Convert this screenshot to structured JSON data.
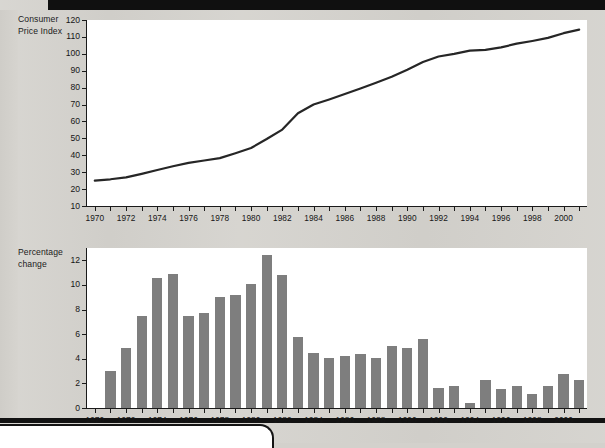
{
  "page": {
    "background_color": "#d4d2cd",
    "bar_color": "#7e7e7e",
    "line_color": "#262626",
    "axis_color": "#1a1a1a",
    "plot_background": "#ffffff"
  },
  "charts": {
    "cpi": {
      "axis_title_line1": "Consumer",
      "axis_title_line2": "Price Index",
      "y_ticks": [
        "120",
        "110",
        "100",
        "90",
        "80",
        "70",
        "60",
        "50",
        "40",
        "30",
        "20",
        "10"
      ],
      "x_ticks": [
        "1970",
        "1972",
        "1974",
        "1976",
        "1978",
        "1980",
        "1982",
        "1984",
        "1986",
        "1988",
        "1990",
        "1992",
        "1994",
        "1996",
        "1998",
        "2000"
      ]
    },
    "pct": {
      "axis_title_line1": "Percentage",
      "axis_title_line2": "change",
      "y_ticks": [
        "12",
        "10",
        "8",
        "6",
        "4",
        "2",
        "0"
      ],
      "x_ticks": [
        "1970",
        "1972",
        "1974",
        "1976",
        "1978",
        "1980",
        "1982",
        "1984",
        "1986",
        "1988",
        "1990",
        "1992",
        "1994",
        "1996",
        "1998",
        "2000"
      ]
    }
  },
  "chart_data": [
    {
      "type": "line",
      "title": "Consumer Price Index",
      "xlabel": "",
      "ylabel": "Consumer Price Index",
      "ylim": [
        10,
        120
      ],
      "xlim": [
        1970,
        2001
      ],
      "grid": false,
      "legend": "none",
      "ytick_values": [
        10,
        20,
        30,
        40,
        50,
        60,
        70,
        80,
        90,
        100,
        110,
        120
      ],
      "xtick_labeled": [
        1970,
        1972,
        1974,
        1976,
        1978,
        1980,
        1982,
        1984,
        1986,
        1988,
        1990,
        1992,
        1994,
        1996,
        1998,
        2000
      ],
      "x": [
        1970,
        1971,
        1972,
        1973,
        1974,
        1975,
        1976,
        1977,
        1978,
        1979,
        1980,
        1981,
        1982,
        1983,
        1984,
        1985,
        1986,
        1987,
        1988,
        1989,
        1990,
        1991,
        1992,
        1993,
        1994,
        1995,
        1996,
        1997,
        1998,
        1999,
        2000,
        2001
      ],
      "values": [
        25.0,
        25.8,
        26.9,
        29.0,
        31.3,
        33.5,
        35.5,
        36.9,
        38.3,
        41.2,
        44.3,
        49.6,
        55.2,
        64.9,
        70.0,
        73.0,
        76.2,
        79.5,
        82.9,
        86.4,
        90.6,
        95.2,
        98.4,
        100.0,
        101.9,
        102.3,
        103.8,
        106.0,
        107.6,
        109.4,
        112.2,
        114.3
      ]
    },
    {
      "type": "bar",
      "title": "Percentage change",
      "xlabel": "",
      "ylabel": "Percentage change",
      "ylim": [
        0,
        13
      ],
      "grid": false,
      "legend": "none",
      "ytick_values": [
        0,
        2,
        4,
        6,
        8,
        10,
        12
      ],
      "xtick_labeled": [
        1970,
        1972,
        1974,
        1976,
        1978,
        1980,
        1982,
        1984,
        1986,
        1988,
        1990,
        1992,
        1994,
        1996,
        1998,
        2000
      ],
      "categories": [
        1971,
        1972,
        1973,
        1974,
        1975,
        1976,
        1977,
        1978,
        1979,
        1980,
        1981,
        1982,
        1983,
        1984,
        1985,
        1986,
        1987,
        1988,
        1989,
        1990,
        1991,
        1992,
        1993,
        1994,
        1995,
        1996,
        1997,
        1998,
        1999,
        2000,
        2001
      ],
      "values": [
        3.0,
        4.9,
        7.5,
        10.6,
        10.9,
        7.5,
        7.75,
        9.0,
        9.2,
        10.1,
        12.4,
        10.8,
        5.8,
        4.45,
        4.1,
        4.2,
        4.35,
        4.1,
        5.0,
        4.9,
        5.6,
        1.6,
        1.8,
        0.4,
        2.3,
        1.55,
        1.8,
        1.1,
        1.75,
        2.75,
        2.25
      ]
    }
  ]
}
